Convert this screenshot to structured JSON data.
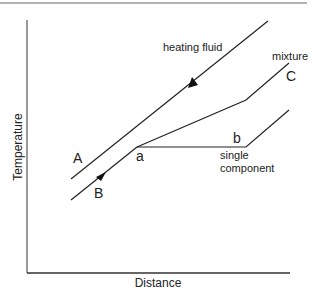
{
  "figure": {
    "top_rule": {
      "x1": 0,
      "y1": 3,
      "x2": 307,
      "y2": 3,
      "color": "#9a9a9a"
    },
    "axes": {
      "x_label": "Distance",
      "y_label": "Temperature",
      "color": "#333333"
    },
    "curves": {
      "heating_fluid": {
        "label": "heating fluid",
        "letter": "A",
        "points": "71,179 268,21",
        "flow_direction": "decreasing distance"
      },
      "process_stream": {
        "letter": "B",
        "points": "71,200 137,147",
        "flow_direction": "increasing distance",
        "bubble_point_label": "a"
      },
      "mixture": {
        "label": "mixture",
        "letter": "C",
        "points": "137,147 246,100 289,63"
      },
      "single_component": {
        "label_line1": "single",
        "label_line2": "component",
        "dew_point_label": "b",
        "points": "137,147 246,147 289,110"
      }
    },
    "line_color": "#222222"
  }
}
